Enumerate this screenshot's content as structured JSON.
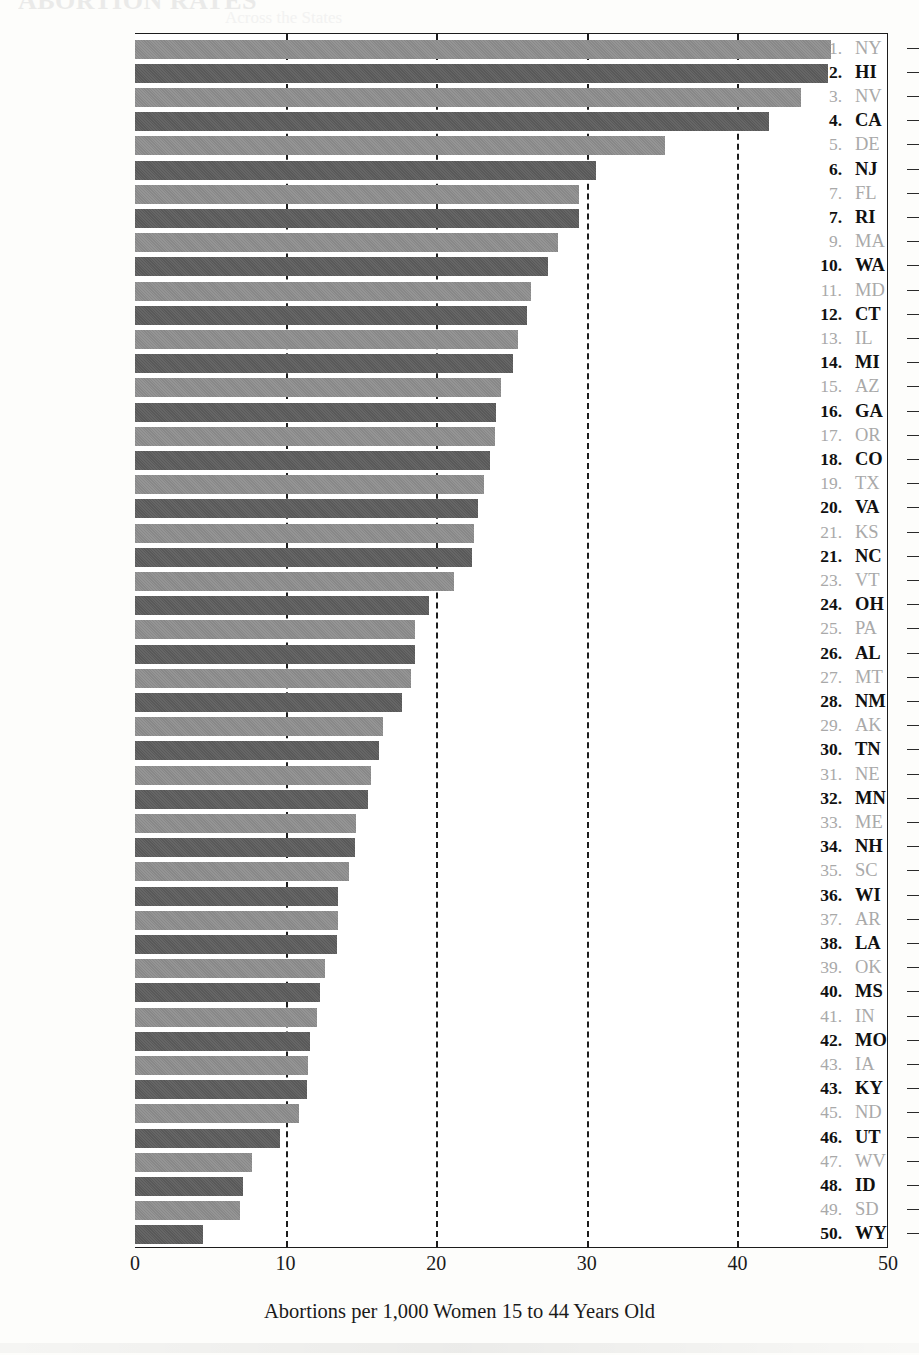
{
  "figure": {
    "ghost_title": "ABORTION RATES",
    "ghost_subtitle": "Across the States"
  },
  "axis": {
    "x_title": "Abortions per 1,000 Women 15 to 44 Years Old",
    "x_ticks": [
      "0",
      "10",
      "20",
      "30",
      "40",
      "50"
    ]
  },
  "chart_data": {
    "type": "bar",
    "orientation": "horizontal",
    "title": "",
    "xlabel": "Abortions per 1,000 Women 15 to 44 Years Old",
    "ylabel": "",
    "xlim": [
      0,
      50
    ],
    "xticks": [
      0,
      10,
      20,
      30,
      40,
      50
    ],
    "grid": "vertical dashed gridlines at 10, 20, 30, 40",
    "legend": "none",
    "categories": [
      "NY",
      "HI",
      "NV",
      "CA",
      "DE",
      "NJ",
      "FL",
      "RI",
      "MA",
      "WA",
      "MD",
      "CT",
      "IL",
      "MI",
      "AZ",
      "GA",
      "OR",
      "CO",
      "TX",
      "VA",
      "KS",
      "NC",
      "VT",
      "OH",
      "PA",
      "AL",
      "MT",
      "NM",
      "AK",
      "TN",
      "NE",
      "MN",
      "ME",
      "NH",
      "SC",
      "WI",
      "AR",
      "LA",
      "OK",
      "MS",
      "IN",
      "MO",
      "IA",
      "KY",
      "ND",
      "UT",
      "WV",
      "ID",
      "SD",
      "WY"
    ],
    "values": [
      46.2,
      46.0,
      44.2,
      42.1,
      35.2,
      30.6,
      29.5,
      29.5,
      28.1,
      27.4,
      26.3,
      26.0,
      25.4,
      25.1,
      24.3,
      24.0,
      23.9,
      23.6,
      23.2,
      22.8,
      22.5,
      22.4,
      21.2,
      19.5,
      18.6,
      18.6,
      18.3,
      17.7,
      16.5,
      16.2,
      15.7,
      15.5,
      14.7,
      14.6,
      14.2,
      13.5,
      13.5,
      13.4,
      12.6,
      12.3,
      12.1,
      11.6,
      11.5,
      11.4,
      10.9,
      9.6,
      7.8,
      7.2,
      7.0,
      4.5
    ],
    "rows": [
      {
        "rank": "1.",
        "abbr": "NY",
        "value": 46.2
      },
      {
        "rank": "2.",
        "abbr": "HI",
        "value": 46.0
      },
      {
        "rank": "3.",
        "abbr": "NV",
        "value": 44.2
      },
      {
        "rank": "4.",
        "abbr": "CA",
        "value": 42.1
      },
      {
        "rank": "5.",
        "abbr": "DE",
        "value": 35.2
      },
      {
        "rank": "6.",
        "abbr": "NJ",
        "value": 30.6
      },
      {
        "rank": "7.",
        "abbr": "FL",
        "value": 29.5
      },
      {
        "rank": "7.",
        "abbr": "RI",
        "value": 29.5
      },
      {
        "rank": "9.",
        "abbr": "MA",
        "value": 28.1
      },
      {
        "rank": "10.",
        "abbr": "WA",
        "value": 27.4
      },
      {
        "rank": "11.",
        "abbr": "MD",
        "value": 26.3
      },
      {
        "rank": "12.",
        "abbr": "CT",
        "value": 26.0
      },
      {
        "rank": "13.",
        "abbr": "IL",
        "value": 25.4
      },
      {
        "rank": "14.",
        "abbr": "MI",
        "value": 25.1
      },
      {
        "rank": "15.",
        "abbr": "AZ",
        "value": 24.3
      },
      {
        "rank": "16.",
        "abbr": "GA",
        "value": 24.0
      },
      {
        "rank": "17.",
        "abbr": "OR",
        "value": 23.9
      },
      {
        "rank": "18.",
        "abbr": "CO",
        "value": 23.6
      },
      {
        "rank": "19.",
        "abbr": "TX",
        "value": 23.2
      },
      {
        "rank": "20.",
        "abbr": "VA",
        "value": 22.8
      },
      {
        "rank": "21.",
        "abbr": "KS",
        "value": 22.5
      },
      {
        "rank": "21.",
        "abbr": "NC",
        "value": 22.4
      },
      {
        "rank": "23.",
        "abbr": "VT",
        "value": 21.2
      },
      {
        "rank": "24.",
        "abbr": "OH",
        "value": 19.5
      },
      {
        "rank": "25.",
        "abbr": "PA",
        "value": 18.6
      },
      {
        "rank": "26.",
        "abbr": "AL",
        "value": 18.6
      },
      {
        "rank": "27.",
        "abbr": "MT",
        "value": 18.3
      },
      {
        "rank": "28.",
        "abbr": "NM",
        "value": 17.7
      },
      {
        "rank": "29.",
        "abbr": "AK",
        "value": 16.5
      },
      {
        "rank": "30.",
        "abbr": "TN",
        "value": 16.2
      },
      {
        "rank": "31.",
        "abbr": "NE",
        "value": 15.7
      },
      {
        "rank": "32.",
        "abbr": "MN",
        "value": 15.5
      },
      {
        "rank": "33.",
        "abbr": "ME",
        "value": 14.7
      },
      {
        "rank": "34.",
        "abbr": "NH",
        "value": 14.6
      },
      {
        "rank": "35.",
        "abbr": "SC",
        "value": 14.2
      },
      {
        "rank": "36.",
        "abbr": "WI",
        "value": 13.5
      },
      {
        "rank": "37.",
        "abbr": "AR",
        "value": 13.5
      },
      {
        "rank": "38.",
        "abbr": "LA",
        "value": 13.4
      },
      {
        "rank": "39.",
        "abbr": "OK",
        "value": 12.6
      },
      {
        "rank": "40.",
        "abbr": "MS",
        "value": 12.3
      },
      {
        "rank": "41.",
        "abbr": "IN",
        "value": 12.1
      },
      {
        "rank": "42.",
        "abbr": "MO",
        "value": 11.6
      },
      {
        "rank": "43.",
        "abbr": "IA",
        "value": 11.5
      },
      {
        "rank": "43.",
        "abbr": "KY",
        "value": 11.4
      },
      {
        "rank": "45.",
        "abbr": "ND",
        "value": 10.9
      },
      {
        "rank": "46.",
        "abbr": "UT",
        "value": 9.6
      },
      {
        "rank": "47.",
        "abbr": "WV",
        "value": 7.8
      },
      {
        "rank": "48.",
        "abbr": "ID",
        "value": 7.2
      },
      {
        "rank": "49.",
        "abbr": "SD",
        "value": 7.0
      },
      {
        "rank": "50.",
        "abbr": "WY",
        "value": 4.5
      }
    ]
  }
}
